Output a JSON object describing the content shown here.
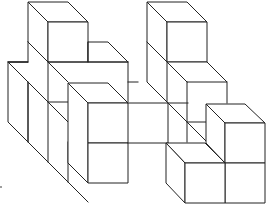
{
  "figure": {
    "title": "Isometric cube arrangement",
    "stroke_color": "#222222",
    "background_color": "#ffffff",
    "cube_size_px": 40,
    "depth_offset_px": [
      20,
      20
    ],
    "mark": "."
  },
  "structures": [
    {
      "name": "left-tower",
      "height_cubes": 2
    },
    {
      "name": "left-low-row",
      "height_cubes": 2
    },
    {
      "name": "front-left-column",
      "height_cubes": 2
    },
    {
      "name": "middle-bridge",
      "height_cubes": 1
    },
    {
      "name": "right-tower",
      "height_cubes": 2
    },
    {
      "name": "right-front-block",
      "height_cubes": 2
    }
  ]
}
